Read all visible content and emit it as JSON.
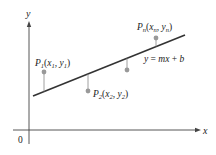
{
  "diagram": {
    "colors": {
      "axis": "#444444",
      "line": "#333333",
      "point": "#999999",
      "residual": "#888888",
      "text": "#222222"
    },
    "axes": {
      "x_label": "x",
      "y_label": "y",
      "origin_label": "0"
    },
    "line": {
      "equation_label": "y = mx + b",
      "equation_parts": {
        "y": "y",
        "eq": " = ",
        "mx": "mx",
        "plus": " + ",
        "b": "b"
      }
    },
    "points": [
      {
        "name": "P",
        "sub": "1",
        "label_x": "x",
        "label_y": "y",
        "xsub": "1",
        "ysub": "1"
      },
      {
        "name": "P",
        "sub": "2",
        "label_x": "x",
        "label_y": "y",
        "xsub": "2",
        "ysub": "2"
      },
      {
        "name": "",
        "sub": "",
        "label_x": "",
        "label_y": "",
        "xsub": "",
        "ysub": ""
      },
      {
        "name": "P",
        "sub": "n",
        "label_x": "x",
        "label_y": "y",
        "xsub": "n",
        "ysub": "n"
      }
    ]
  }
}
